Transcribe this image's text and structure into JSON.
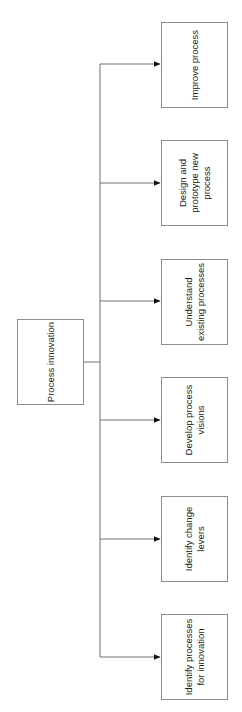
{
  "diagram": {
    "root": {
      "label": "Process innovation"
    },
    "children": [
      {
        "label": "Improve process"
      },
      {
        "label": "Design and\nprototype new\nprocess"
      },
      {
        "label": "Understand\nexisting processes"
      },
      {
        "label": "Develop process\nvisions"
      },
      {
        "label": "Identify change\nlevers"
      },
      {
        "label": "Identify processes\nfor innovation"
      }
    ],
    "colors": {
      "line": "#707070",
      "box_border": "#8c8c8c",
      "text": "#222222",
      "arrow": "#111111"
    }
  }
}
